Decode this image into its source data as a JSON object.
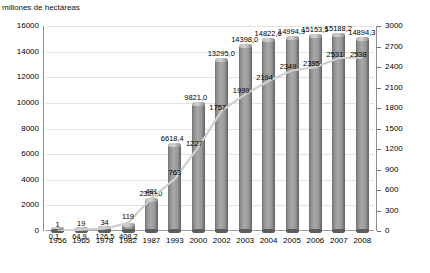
{
  "chart_data": {
    "type": "bar",
    "title": "",
    "ylabel": "millones de hectáreas",
    "xlabel": "",
    "categories": [
      "1956",
      "1965",
      "1978",
      "1982",
      "1987",
      "1993",
      "2000",
      "2002",
      "2003",
      "2004",
      "2005",
      "2006",
      "2007",
      "2008"
    ],
    "ylim": [
      0,
      16000
    ],
    "y_ticks": [
      "0",
      "2000",
      "4000",
      "6000",
      "8000",
      "10000",
      "12000",
      "14000",
      "16000"
    ],
    "y2lim": [
      0,
      3000
    ],
    "y2_ticks": [
      "0",
      "300",
      "600",
      "900",
      "1200",
      "1500",
      "1800",
      "2100",
      "2400",
      "2700",
      "3000"
    ],
    "grid": true,
    "legend": "none",
    "series": [
      {
        "name": "superficie",
        "kind": "bar",
        "axis": "left",
        "values": [
          0.1,
          64.9,
          126.5,
          408.2,
          2320.0,
          6618.4,
          9821.0,
          13295.0,
          14398.0,
          14822.6,
          14994.9,
          15153.5,
          15188.2,
          14894.3
        ],
        "labels": [
          "0,1",
          "64,9",
          "126,5",
          "408,2",
          "2320,0",
          "6618,4",
          "9821,0",
          "13295,0",
          "14398,0",
          "14822,6",
          "14994,9",
          "15153,5",
          "15188,2",
          "14894,3"
        ]
      },
      {
        "name": "numero",
        "kind": "line",
        "axis": "right",
        "values": [
          1,
          19,
          34,
          119,
          481,
          763,
          1227,
          1757,
          1999,
          2194,
          2349,
          2395,
          2531,
          2538
        ],
        "labels": [
          "1",
          "19",
          "34",
          "119",
          "481",
          "763",
          "1227",
          "1757",
          "1999",
          "2194",
          "2349",
          "2395",
          "2531",
          "2538"
        ]
      }
    ]
  },
  "colors": {
    "bar_light": "#a8a8a8",
    "bar_dark": "#616161",
    "grid": "#e2e2e2",
    "axis": "#8d8d8d",
    "line": "#c9c9c9",
    "text": "#000000"
  }
}
